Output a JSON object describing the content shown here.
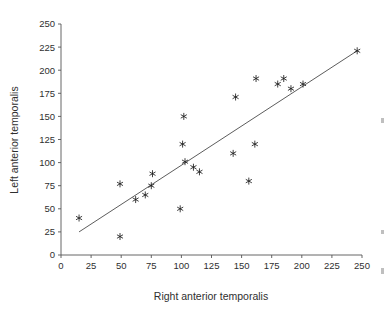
{
  "chart_data": {
    "type": "scatter",
    "title": "",
    "subtitle": "",
    "xlabel": "Right anterior temporalis",
    "ylabel": "Left anterior temporalis",
    "xlim": [
      0,
      250
    ],
    "ylim": [
      0,
      250
    ],
    "xticks": [
      0,
      25,
      50,
      75,
      100,
      125,
      150,
      175,
      200,
      225,
      250
    ],
    "yticks": [
      0,
      25,
      50,
      75,
      100,
      125,
      150,
      175,
      200,
      225,
      250
    ],
    "xtick_labels": [
      "0",
      "25",
      "50",
      "75",
      "100",
      "125",
      "150",
      "175",
      "200",
      "225",
      "250"
    ],
    "ytick_labels": [
      "0",
      "25",
      "50",
      "75",
      "100",
      "125",
      "150",
      "175",
      "200",
      "225",
      "250"
    ],
    "grid": false,
    "legend": null,
    "legend_position": "none",
    "marker_symbol": "asterisk",
    "marker_color": "#1d1d1d",
    "points": [
      {
        "x": 15,
        "y": 40
      },
      {
        "x": 49,
        "y": 20
      },
      {
        "x": 49,
        "y": 77
      },
      {
        "x": 62,
        "y": 60
      },
      {
        "x": 70,
        "y": 65
      },
      {
        "x": 75,
        "y": 75
      },
      {
        "x": 76,
        "y": 88
      },
      {
        "x": 99,
        "y": 50
      },
      {
        "x": 101,
        "y": 120
      },
      {
        "x": 102,
        "y": 150
      },
      {
        "x": 103,
        "y": 101
      },
      {
        "x": 110,
        "y": 95
      },
      {
        "x": 115,
        "y": 90
      },
      {
        "x": 143,
        "y": 110
      },
      {
        "x": 145,
        "y": 171
      },
      {
        "x": 156,
        "y": 80
      },
      {
        "x": 161,
        "y": 120
      },
      {
        "x": 162,
        "y": 191
      },
      {
        "x": 180,
        "y": 185
      },
      {
        "x": 185,
        "y": 191
      },
      {
        "x": 191,
        "y": 180
      },
      {
        "x": 201,
        "y": 185
      },
      {
        "x": 246,
        "y": 221
      }
    ],
    "fit_line": {
      "label": "regression line",
      "x_start": 15,
      "y_start": 25,
      "x_end": 246,
      "y_end": 221
    }
  }
}
